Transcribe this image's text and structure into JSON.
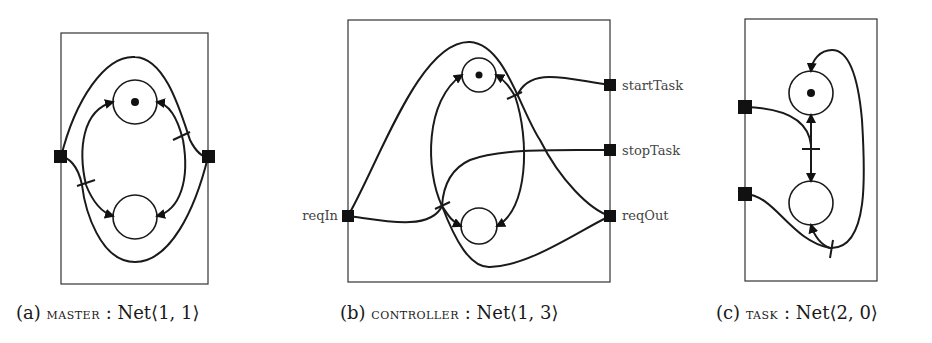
{
  "figure": {
    "panels": [
      {
        "id": "a",
        "caption": {
          "tag": "(a)",
          "name": "master",
          "separator": ":",
          "type": "Net⟨1, 1⟩"
        },
        "left_ports": 1,
        "right_ports": 1,
        "places": [
          {
            "position": "top",
            "marked": true
          },
          {
            "position": "bottom",
            "marked": false
          }
        ],
        "port_labels": []
      },
      {
        "id": "b",
        "caption": {
          "tag": "(b)",
          "name": "controller",
          "separator": ":",
          "type": "Net⟨1, 3⟩"
        },
        "left_ports": 1,
        "right_ports": 3,
        "places": [
          {
            "position": "top",
            "marked": true
          },
          {
            "position": "bottom",
            "marked": false
          }
        ],
        "port_labels": {
          "left": [
            "reqIn"
          ],
          "right": [
            "startTask",
            "stopTask",
            "reqOut"
          ]
        }
      },
      {
        "id": "c",
        "caption": {
          "tag": "(c)",
          "name": "task",
          "separator": ":",
          "type": "Net⟨2, 0⟩"
        },
        "left_ports": 2,
        "right_ports": 0,
        "places": [
          {
            "position": "top",
            "marked": true
          },
          {
            "position": "bottom",
            "marked": false
          }
        ],
        "port_labels": []
      }
    ]
  }
}
